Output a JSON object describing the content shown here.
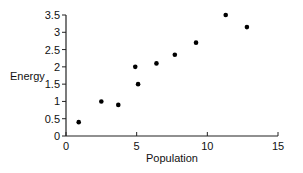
{
  "chart_data": {
    "type": "scatter",
    "title": "",
    "xlabel": "Population",
    "ylabel": "Energy",
    "xlim": [
      0,
      15
    ],
    "ylim": [
      0,
      3.5
    ],
    "xticks": [
      0,
      5,
      10,
      15
    ],
    "xtick_labels": [
      "0",
      "5",
      "10",
      "15"
    ],
    "yticks": [
      0,
      0.5,
      1,
      1.5,
      2,
      2.5,
      3,
      3.5
    ],
    "ytick_labels": [
      "0",
      "0.5",
      "1",
      "1.5",
      "2",
      "2.5",
      "3",
      "3.5"
    ],
    "grid": false,
    "legend": null,
    "series": [
      {
        "name": "data",
        "points": [
          {
            "x": 0.9,
            "y": 0.4
          },
          {
            "x": 2.5,
            "y": 1.0
          },
          {
            "x": 3.7,
            "y": 0.9
          },
          {
            "x": 4.9,
            "y": 2.0
          },
          {
            "x": 5.1,
            "y": 1.5
          },
          {
            "x": 6.4,
            "y": 2.1
          },
          {
            "x": 7.7,
            "y": 2.35
          },
          {
            "x": 9.2,
            "y": 2.7
          },
          {
            "x": 11.3,
            "y": 3.5
          },
          {
            "x": 12.8,
            "y": 3.15
          }
        ]
      }
    ],
    "colors": {
      "marker": "#000000",
      "axis": "#222222"
    }
  }
}
